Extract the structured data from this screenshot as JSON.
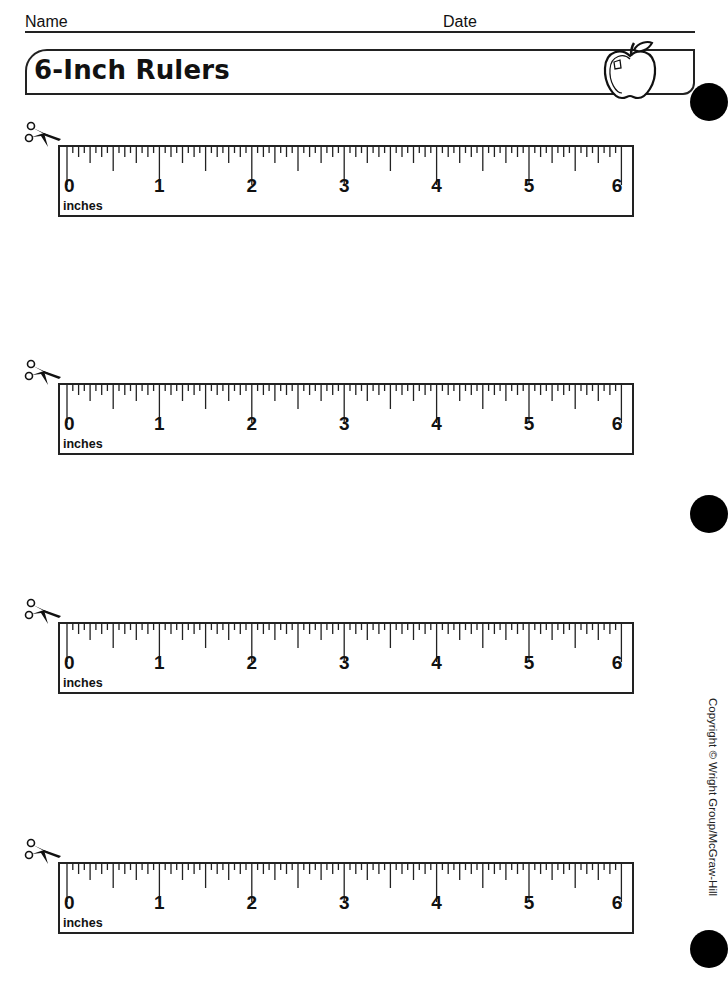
{
  "header": {
    "name_label": "Name",
    "date_label": "Date",
    "title": "6-Inch Rulers",
    "decoration_icon": "apple-icon"
  },
  "rulers": [
    {
      "top": 145,
      "scissors_top": 120,
      "unit": "inches",
      "labels": [
        "0",
        "1",
        "2",
        "3",
        "4",
        "5",
        "6"
      ]
    },
    {
      "top": 383,
      "scissors_top": 358,
      "unit": "inches",
      "labels": [
        "0",
        "1",
        "2",
        "3",
        "4",
        "5",
        "6"
      ]
    },
    {
      "top": 622,
      "scissors_top": 597,
      "unit": "inches",
      "labels": [
        "0",
        "1",
        "2",
        "3",
        "4",
        "5",
        "6"
      ]
    },
    {
      "top": 862,
      "scissors_top": 837,
      "unit": "inches",
      "labels": [
        "0",
        "1",
        "2",
        "3",
        "4",
        "5",
        "6"
      ]
    }
  ],
  "ruler_spec": {
    "length_inches": 6,
    "subdivisions_per_inch": 16,
    "cut_icon": "scissors-icon"
  },
  "footer": {
    "copyright": "Copyright © Wright Group/McGraw-Hill"
  },
  "binder_holes": [
    {
      "left": 690,
      "top": 83
    },
    {
      "left": 690,
      "top": 495
    },
    {
      "left": 690,
      "top": 930
    }
  ]
}
